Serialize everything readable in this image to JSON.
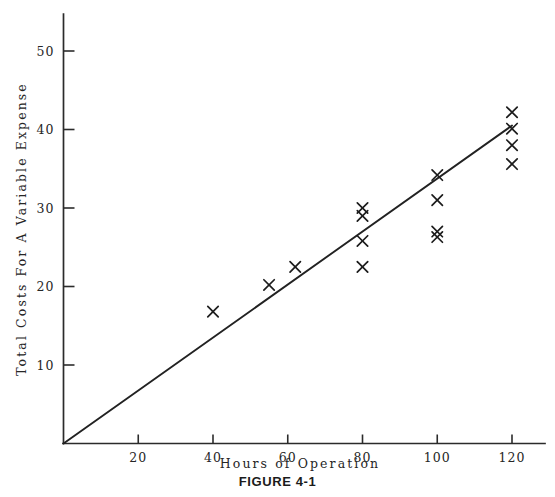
{
  "figure": {
    "caption": "FIGURE 4-1"
  },
  "chart_data": {
    "type": "scatter",
    "title": "",
    "xlabel": "Hours of Operation",
    "ylabel": "Total Costs For A Variable Expense",
    "xlim": [
      0,
      132
    ],
    "ylim": [
      0,
      56
    ],
    "grid": false,
    "legend": null,
    "xticks": [
      20,
      40,
      60,
      80,
      100,
      120
    ],
    "xtick_labels": [
      "20",
      "40",
      "60",
      "80",
      "100",
      "120"
    ],
    "yticks": [
      10,
      20,
      30,
      40,
      50
    ],
    "ytick_labels": [
      "10",
      "20",
      "30",
      "40",
      "50"
    ],
    "marker": "x",
    "points": [
      {
        "x": 40,
        "y": 16.8
      },
      {
        "x": 55,
        "y": 20.2
      },
      {
        "x": 62,
        "y": 22.5
      },
      {
        "x": 80,
        "y": 30.0
      },
      {
        "x": 80,
        "y": 29.0
      },
      {
        "x": 80,
        "y": 25.8
      },
      {
        "x": 80,
        "y": 22.5
      },
      {
        "x": 100,
        "y": 34.2
      },
      {
        "x": 100,
        "y": 31.0
      },
      {
        "x": 100,
        "y": 27.0
      },
      {
        "x": 100,
        "y": 26.3
      },
      {
        "x": 120,
        "y": 42.2
      },
      {
        "x": 120,
        "y": 40.1
      },
      {
        "x": 120,
        "y": 38.0
      },
      {
        "x": 120,
        "y": 35.6
      }
    ],
    "trend_line": {
      "from": {
        "x": 0,
        "y": 0
      },
      "to": {
        "x": 120,
        "y": 40.5
      },
      "description": "variable-cost regression line through origin"
    },
    "colors": {
      "axis": "#2b2b2b",
      "marker": "#1c1c1c",
      "trend": "#222222",
      "background": "#ffffff"
    }
  }
}
